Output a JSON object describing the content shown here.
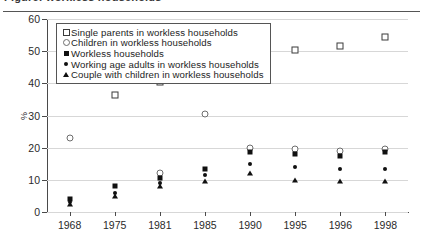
{
  "header": {
    "title": "Figure: workless households",
    "rule": "horizontal-rule"
  },
  "axis": {
    "y_unit": "%",
    "y_ticks": [
      "0",
      "10",
      "20",
      "30",
      "40",
      "50",
      "60"
    ],
    "x_ticks": [
      "1968",
      "1975",
      "1981",
      "1985",
      "1990",
      "1995",
      "1996",
      "1998"
    ]
  },
  "legend": {
    "items": [
      {
        "marker": "open-square",
        "label": "Single parents in workless households"
      },
      {
        "marker": "open-circle",
        "label": "Children in workless households"
      },
      {
        "marker": "filled-square",
        "label": "Workless households"
      },
      {
        "marker": "filled-diamond",
        "label": "Working age adults in workless households"
      },
      {
        "marker": "filled-triangle",
        "label": "Couple with children in workless households"
      }
    ]
  },
  "chart_data": {
    "type": "scatter",
    "title": "Figure: workless households",
    "xlabel": "",
    "ylabel": "%",
    "ylim": [
      0,
      60
    ],
    "ytick_step": 10,
    "grid": true,
    "legend_position": "top-left-inside",
    "categories": [
      "1968",
      "1975",
      "1981",
      "1985",
      "1990",
      "1995",
      "1996",
      "1998"
    ],
    "series": [
      {
        "name": "Single parents in workless households",
        "marker": "open-square",
        "values": [
          null,
          36.5,
          40.5,
          49.0,
          49.0,
          50.5,
          51.5,
          54.5
        ]
      },
      {
        "name": "Children in workless households",
        "marker": "open-circle",
        "values": [
          23.0,
          null,
          12.0,
          30.5,
          20.0,
          19.5,
          19.0,
          19.5
        ]
      },
      {
        "name": "Workless households",
        "marker": "filled-square",
        "values": [
          4.0,
          8.0,
          10.5,
          13.5,
          18.5,
          18.0,
          17.5,
          18.5
        ]
      },
      {
        "name": "Working age adults in workless households",
        "marker": "filled-diamond",
        "values": [
          3.0,
          6.0,
          9.0,
          11.5,
          15.0,
          14.0,
          13.5,
          13.5
        ]
      },
      {
        "name": "Couple with children in workless households",
        "marker": "filled-triangle",
        "values": [
          2.5,
          5.0,
          8.0,
          9.5,
          12.0,
          10.0,
          9.5,
          9.5
        ]
      }
    ]
  }
}
